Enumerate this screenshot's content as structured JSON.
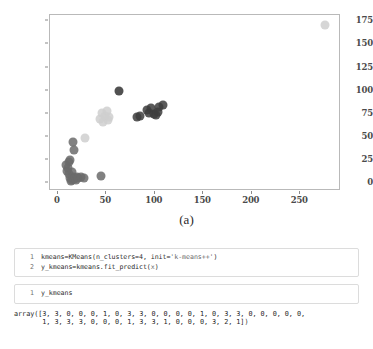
{
  "figure": {
    "caption_a": "(a)",
    "caption_b": "(b)",
    "axes": {
      "xticks": [
        "0",
        "50",
        "100",
        "150",
        "200",
        "250"
      ],
      "yticks": [
        "0",
        "25",
        "50",
        "75",
        "100",
        "125",
        "150",
        "175"
      ]
    }
  },
  "chart_data": {
    "type": "scatter",
    "title": "",
    "xlabel": "",
    "ylabel": "",
    "xlim": [
      -8,
      292
    ],
    "ylim": [
      -9,
      182
    ],
    "grid": false,
    "legend": null,
    "xticks": [
      0,
      50,
      100,
      150,
      200,
      250
    ],
    "yticks": [
      0,
      25,
      50,
      75,
      100,
      125,
      150,
      175
    ],
    "marker_size": 9,
    "marker_opacity": 0.85,
    "series": [
      {
        "name": "cluster-0-dark-gray",
        "color": "#6b6b6b",
        "points": [
          [
            9,
            19
          ],
          [
            10,
            13
          ],
          [
            11,
            16
          ],
          [
            12,
            22
          ],
          [
            12,
            9
          ],
          [
            13,
            5
          ],
          [
            13,
            25
          ],
          [
            14,
            2
          ],
          [
            15,
            3
          ],
          [
            15,
            12
          ],
          [
            16,
            44
          ],
          [
            16,
            6
          ],
          [
            17,
            36
          ],
          [
            17,
            4
          ],
          [
            18,
            5
          ],
          [
            19,
            3
          ],
          [
            20,
            6
          ],
          [
            21,
            5
          ],
          [
            24,
            6
          ],
          [
            27,
            5
          ],
          [
            45,
            7
          ]
        ]
      },
      {
        "name": "cluster-1-light-gray",
        "color": "#cfcfcf",
        "points": [
          [
            28,
            48
          ],
          [
            44,
            69
          ],
          [
            46,
            76
          ],
          [
            47,
            66
          ],
          [
            49,
            72
          ],
          [
            51,
            78
          ],
          [
            52,
            68
          ],
          [
            53,
            71
          ],
          [
            275,
            171
          ]
        ]
      },
      {
        "name": "cluster-2-near-black",
        "color": "#333333",
        "points": [
          [
            63,
            99
          ]
        ]
      },
      {
        "name": "cluster-3-dark",
        "color": "#3d3d3d",
        "points": [
          [
            82,
            71
          ],
          [
            85,
            72
          ],
          [
            92,
            79
          ],
          [
            94,
            76
          ],
          [
            96,
            81
          ],
          [
            99,
            75
          ],
          [
            101,
            74
          ],
          [
            103,
            77
          ],
          [
            104,
            82
          ],
          [
            108,
            84
          ]
        ]
      }
    ]
  },
  "notebook": {
    "cells": [
      {
        "name": "kmeans-fit-cell",
        "lines": [
          {
            "number": "1",
            "segments": [
              {
                "text": "kmeans=KMeans(n_clusters=4, init=",
                "style": "plain"
              },
              {
                "text": "'k-means++'",
                "style": "str"
              },
              {
                "text": ")",
                "style": "plain"
              }
            ]
          },
          {
            "number": "2",
            "segments": [
              {
                "text": "y_kmeans=kmeans.fit_predict(",
                "style": "plain"
              },
              {
                "text": "x",
                "style": "dim"
              },
              {
                "text": ")",
                "style": "plain"
              }
            ]
          }
        ]
      },
      {
        "name": "y-kmeans-cell",
        "lines": [
          {
            "number": "1",
            "segments": [
              {
                "text": "y_kmeans",
                "style": "plain"
              }
            ]
          }
        ]
      }
    ],
    "output": "array([3, 3, 0, 0, 0, 1, 0, 3, 3, 0, 0, 0, 0, 1, 0, 3, 3, 0, 0, 0, 0, 0,\n       1, 3, 3, 3, 0, 0, 0, 1, 3, 3, 1, 0, 0, 0, 3, 2, 1])"
  }
}
